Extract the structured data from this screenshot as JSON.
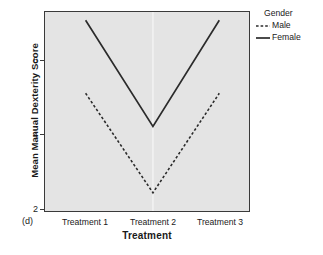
{
  "panel_tag": "(d)",
  "legend": {
    "title": "Gender",
    "entries": [
      {
        "label": "Male",
        "style": "dashed"
      },
      {
        "label": "Female",
        "style": "solid"
      }
    ]
  },
  "axes": {
    "y_title": "Mean Manual Dexterity Score",
    "x_title": "Treatment",
    "y_ticks": [
      "2",
      "4",
      "6"
    ],
    "x_ticks": [
      "Treatment 1",
      "Treatment 2",
      "Treatment 3"
    ]
  },
  "chart_data": {
    "type": "line",
    "title": "",
    "subtitle": "",
    "panel_label": "(d)",
    "xlabel": "Treatment",
    "ylabel": "Mean Manual Dexterity Score",
    "categories": [
      "Treatment 1",
      "Treatment 2",
      "Treatment 3"
    ],
    "series": [
      {
        "name": "Male",
        "style": "dashed",
        "color": "#2b2b2b",
        "values": [
          5.0,
          2.0,
          5.0
        ]
      },
      {
        "name": "Female",
        "style": "solid",
        "color": "#2b2b2b",
        "values": [
          7.2,
          4.0,
          7.2
        ]
      }
    ],
    "legend_title": "Gender",
    "legend_position": "right",
    "ylim": [
      1.45,
      7.45
    ],
    "ytick_values": [
      2,
      4,
      6
    ],
    "grid": false,
    "plot_background": "#e4e4e4",
    "frame_color": "#3a3a3a"
  }
}
